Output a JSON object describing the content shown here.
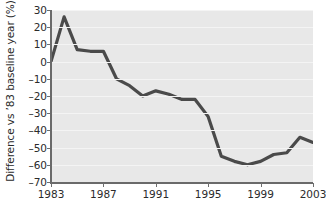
{
  "chart_data": {
    "type": "line",
    "title": "",
    "xlabel": "",
    "ylabel": "Difference vs ’83 baseline year (%)",
    "xlim": [
      1983,
      2003
    ],
    "ylim": [
      -70,
      30
    ],
    "grid": true,
    "legend": null,
    "ytick_labels": [
      "30",
      "20",
      "10",
      "0",
      "–10",
      "–20",
      "–30",
      "–40",
      "–50",
      "–60",
      "–70"
    ],
    "ytick_values": [
      30,
      20,
      10,
      0,
      -10,
      -20,
      -30,
      -40,
      -50,
      -60,
      -70
    ],
    "xtick_labels": [
      "1983",
      "1987",
      "1991",
      "1995",
      "1999",
      "2003"
    ],
    "xtick_values": [
      1983,
      1987,
      1991,
      1995,
      1999,
      2003
    ],
    "line_color": "#4a4a4a",
    "plot_background": "#e8e8e8",
    "gridline_color": "#f4f4f4",
    "series": [
      {
        "name": "Difference vs 1983 baseline",
        "x": [
          1983,
          1984,
          1985,
          1986,
          1987,
          1988,
          1989,
          1990,
          1991,
          1992,
          1993,
          1994,
          1995,
          1996,
          1997,
          1998,
          1999,
          2000,
          2001,
          2002,
          2003
        ],
        "values": [
          0,
          26,
          7,
          6,
          6,
          -10,
          -14,
          -20,
          -17,
          -19,
          -22,
          -22,
          -32,
          -55,
          -58,
          -60,
          -58,
          -54,
          -53,
          -44,
          -47
        ]
      }
    ]
  }
}
